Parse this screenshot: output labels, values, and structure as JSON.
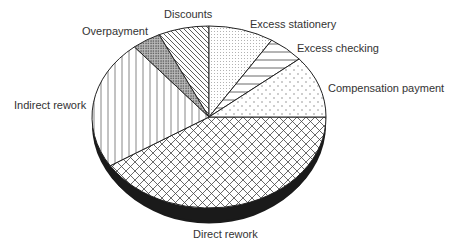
{
  "chart_data": {
    "type": "pie",
    "title": "",
    "style": "3d",
    "slices": [
      {
        "label": "Direct rework",
        "value": 41,
        "pattern": "crosshatch",
        "label_pos": [
          193,
          228
        ]
      },
      {
        "label": "Indirect rework",
        "value": 23,
        "pattern": "vertical",
        "label_pos": [
          14,
          99
        ]
      },
      {
        "label": "Overpayment",
        "value": 4,
        "pattern": "dense-dots",
        "label_pos": [
          82,
          25
        ]
      },
      {
        "label": "Discounts",
        "value": 7,
        "pattern": "diagonal",
        "label_pos": [
          164,
          8
        ]
      },
      {
        "label": "Excess stationery",
        "value": 9,
        "pattern": "fine-dots",
        "label_pos": [
          250,
          18
        ]
      },
      {
        "label": "Excess checking",
        "value": 5,
        "pattern": "horizontal",
        "label_pos": [
          297,
          42
        ]
      },
      {
        "label": "Compensation payment",
        "value": 11,
        "pattern": "sparse-dots",
        "label_pos": [
          328,
          82
        ]
      }
    ],
    "start_angle_deg": 0,
    "direction": "clockwise",
    "legend": "none"
  }
}
